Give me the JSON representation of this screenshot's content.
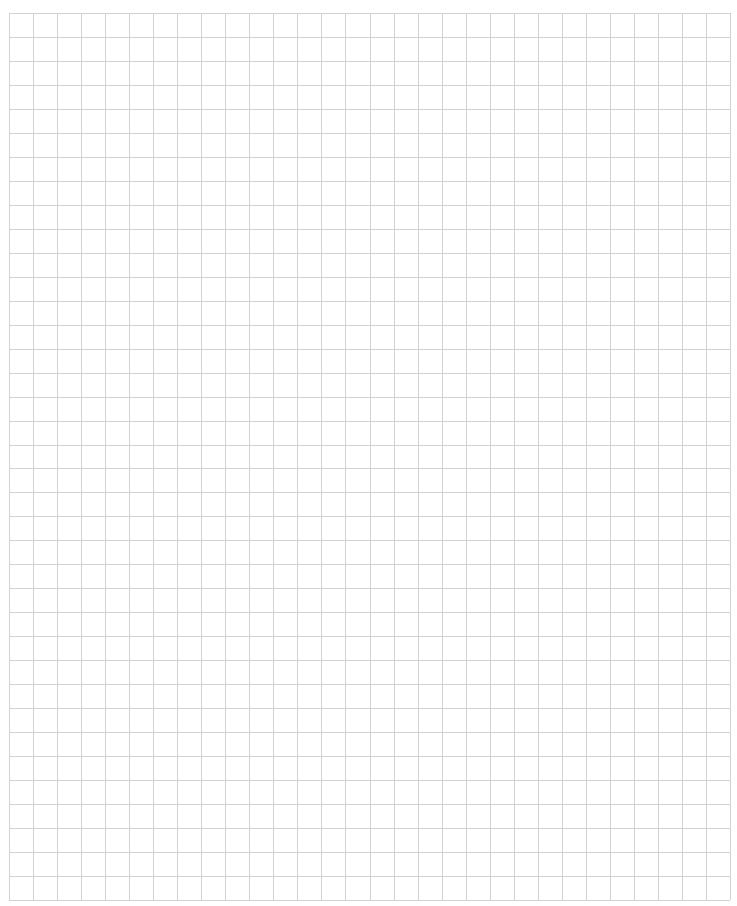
{
  "page": {
    "type": "blank-graph-paper",
    "background_color": "#ffffff"
  },
  "grid": {
    "columns": 30,
    "rows": 37,
    "origin_x": 9,
    "origin_y": 13,
    "width": 721,
    "height": 887,
    "line_color": "#d2d2d2",
    "line_width": 1
  }
}
